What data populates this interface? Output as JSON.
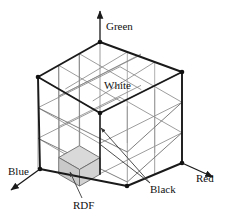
{
  "figure": {
    "labels": {
      "green_axis": "Green",
      "blue_axis": "Blue",
      "red_axis": "Red",
      "white_vertex": "White",
      "black_vertex": "Black",
      "rdf_cell": "RDF"
    },
    "colors": {
      "line": "#1a1a1a",
      "grid_line": "#7d7d7d",
      "rdf_fill_top": "#d9d9d9",
      "rdf_fill_left": "#c9c9c9",
      "rdf_fill_right": "#d2d2d2",
      "leader": "#555555",
      "background": "#ffffff",
      "text": "#111111"
    },
    "geometry": {
      "subdivisions": 3,
      "projection": "isometric",
      "vertices": {
        "top_back": [
          100,
          42
        ],
        "top_left": [
          38,
          77
        ],
        "top_front": [
          100,
          113
        ],
        "top_right": [
          182,
          72
        ],
        "bottom_left": [
          40,
          169
        ],
        "bottom_front": [
          127,
          186
        ],
        "bottom_right": [
          182,
          163
        ]
      },
      "axis_arrows": {
        "green": {
          "from": [
            100,
            42
          ],
          "to": [
            100,
            10
          ]
        },
        "blue": {
          "from": [
            40,
            169
          ],
          "to": [
            8,
            190
          ]
        },
        "red": {
          "from": [
            182,
            163
          ],
          "to": [
            216,
            178
          ]
        }
      }
    }
  }
}
